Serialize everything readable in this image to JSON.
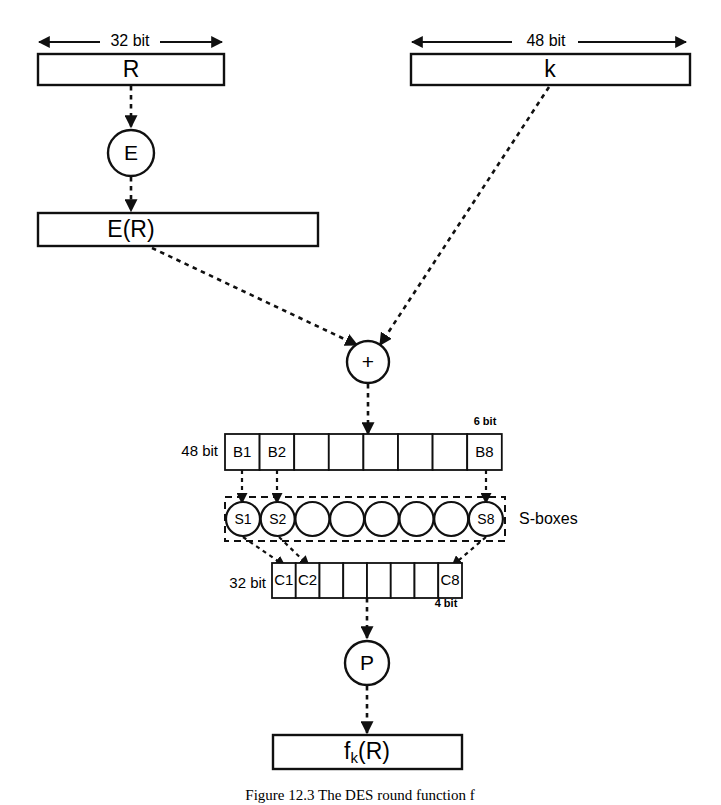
{
  "figure": {
    "caption": "Figure 12.3   The DES round function f",
    "stroke_color": "#101010",
    "background_color": "#ffffff"
  },
  "dimensions": {
    "r_width_label": "32 bit",
    "k_width_label": "48 bit",
    "b_row_label": "48 bit",
    "b_cell_label": "6 bit",
    "c_row_label": "32 bit",
    "c_cell_label": "4 bit"
  },
  "blocks": {
    "input_r": "R",
    "input_k": "k",
    "expansion_output": "E(R)",
    "output": "fₖ (R)",
    "output_base": "f",
    "output_sub": "k",
    "output_tail": "(R)"
  },
  "nodes": {
    "expansion": "E",
    "xor": "+",
    "permutation": "P"
  },
  "sboxes": {
    "title": "S-boxes",
    "items": [
      {
        "label": "S1"
      },
      {
        "label": "S2"
      },
      {
        "label": ""
      },
      {
        "label": ""
      },
      {
        "label": ""
      },
      {
        "label": ""
      },
      {
        "label": ""
      },
      {
        "label": "S8"
      }
    ]
  },
  "b_cells": [
    {
      "label": "B1"
    },
    {
      "label": "B2"
    },
    {
      "label": ""
    },
    {
      "label": ""
    },
    {
      "label": ""
    },
    {
      "label": ""
    },
    {
      "label": ""
    },
    {
      "label": "B8"
    }
  ],
  "c_cells": [
    {
      "label": "C1"
    },
    {
      "label": "C2"
    },
    {
      "label": ""
    },
    {
      "label": ""
    },
    {
      "label": ""
    },
    {
      "label": ""
    },
    {
      "label": ""
    },
    {
      "label": "C8"
    }
  ]
}
